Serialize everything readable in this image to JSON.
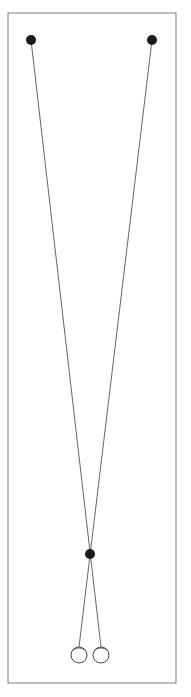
{
  "diagram": {
    "colors": {
      "frame": "#7a7a7a",
      "line": "#555555",
      "dot": "#1a1a1a",
      "ball_stroke": "#333333",
      "background": "#ffffff"
    },
    "frame": {
      "x": 8,
      "y": 13,
      "width": 168,
      "height": 670
    },
    "anchors": [
      {
        "x": 31,
        "y": 40,
        "r": 5
      },
      {
        "x": 152,
        "y": 40,
        "r": 5
      }
    ],
    "pivot": {
      "x": 90,
      "y": 554,
      "r": 5
    },
    "balls": [
      {
        "x": 79,
        "y": 655,
        "r": 8
      },
      {
        "x": 101,
        "y": 655,
        "r": 8
      }
    ],
    "caption": ""
  }
}
